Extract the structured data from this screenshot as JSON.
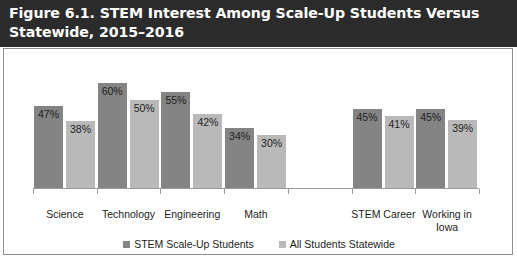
{
  "title": "Figure 6.1. STEM Interest Among Scale-Up Students Versus Statewide, 2015–2016",
  "colors": {
    "banner_background": "#2b2b2b",
    "banner_text": "#ffffff",
    "series_scaleup": "#848484",
    "series_statewide": "#b9b9b9",
    "axis": "#9a9a9a",
    "frame_border": "#8e8e8e",
    "chart_background": "#ffffff"
  },
  "chart_data": {
    "type": "bar",
    "title": "Figure 6.1. STEM Interest Among Scale-Up Students Versus Statewide, 2015–2016",
    "xlabel": "",
    "ylabel": "",
    "ylim": [
      0,
      65
    ],
    "grid": false,
    "legend_position": "bottom",
    "value_labels": true,
    "value_suffix": "%",
    "categories": [
      "Science",
      "Technology",
      "Engineering",
      "Math",
      "",
      "STEM Career",
      "Working in Iowa"
    ],
    "series": [
      {
        "name": "STEM Scale-Up Students",
        "color": "#848484",
        "values": [
          47,
          60,
          55,
          34,
          null,
          45,
          45
        ],
        "labels": [
          "47%",
          "60%",
          "55%",
          "34%",
          "",
          "45%",
          "45%"
        ]
      },
      {
        "name": "All Students Statewide",
        "color": "#b9b9b9",
        "values": [
          38,
          50,
          42,
          30,
          null,
          41,
          39
        ],
        "labels": [
          "38%",
          "50%",
          "42%",
          "30%",
          "",
          "41%",
          "39%"
        ]
      }
    ]
  },
  "legend": [
    {
      "label": "STEM Scale-Up Students",
      "color": "#848484"
    },
    {
      "label": "All Students Statewide",
      "color": "#b9b9b9"
    }
  ]
}
